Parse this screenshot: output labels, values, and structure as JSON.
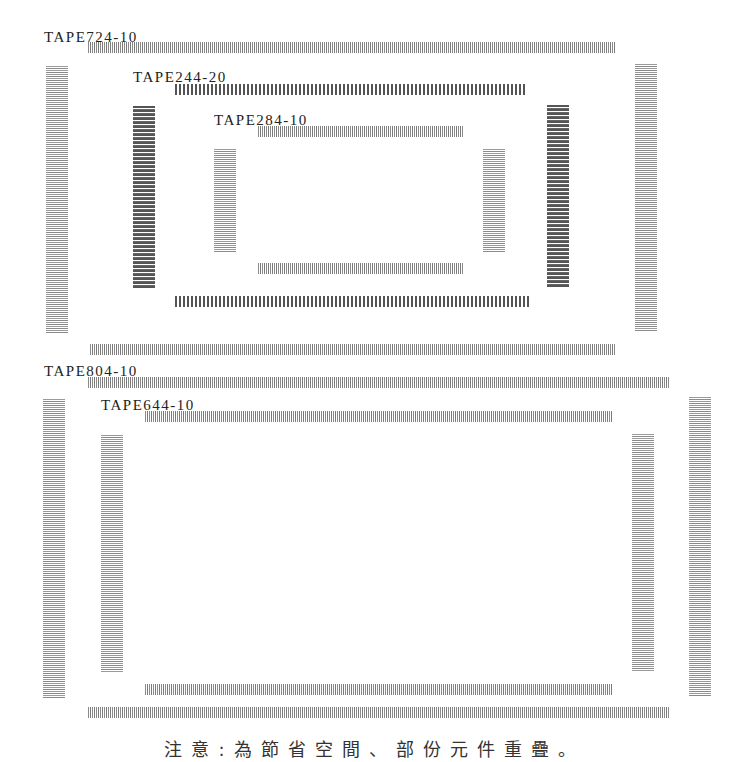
{
  "packages": [
    {
      "label": "TAPE724-10"
    },
    {
      "label": "TAPE244-20"
    },
    {
      "label": "TAPE284-10"
    },
    {
      "label": "TAPE804-10"
    },
    {
      "label": "TAPE644-10"
    }
  ],
  "note": "注意:為節省空間、部份元件重疊。",
  "colors": {
    "pin_light": "#8a8a8a",
    "pin_dark": "#555555",
    "text": "#222222",
    "background": "#ffffff"
  }
}
